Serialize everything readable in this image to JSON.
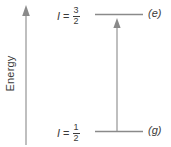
{
  "figure": {
    "type": "energy-level-diagram",
    "width": 171,
    "height": 147,
    "background": "#ffffff",
    "stroke_color": "#808080",
    "text_color": "#3b3b3b"
  },
  "axis": {
    "label": "Energy",
    "direction": "up",
    "arrow_head": "up-arrow-icon"
  },
  "levels": [
    {
      "id": "excited",
      "spin_symbol": "I",
      "equals": "=",
      "numerator": "3",
      "denominator": "2",
      "state_tag": "(e)",
      "y": 14
    },
    {
      "id": "ground",
      "spin_symbol": "I",
      "equals": "=",
      "numerator": "1",
      "denominator": "2",
      "state_tag": "(g)",
      "y": 131
    }
  ],
  "transition": {
    "name": "excitation-arrow",
    "direction": "up",
    "from_level": "ground",
    "to_level": "excited"
  }
}
